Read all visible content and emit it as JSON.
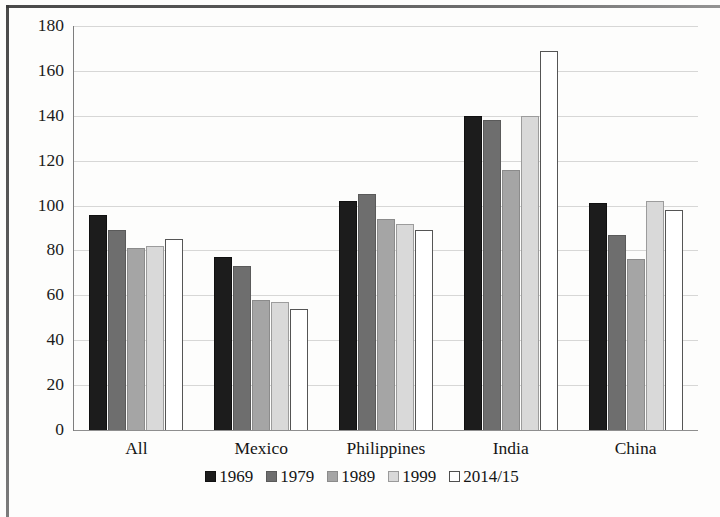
{
  "chart_data": {
    "type": "bar",
    "title": "",
    "subtitle": "",
    "xlabel": "",
    "ylabel": "",
    "categories": [
      "All",
      "Mexico",
      "Philippines",
      "India",
      "China"
    ],
    "series": [
      {
        "name": "1969",
        "color": "#1c1c1c",
        "values": [
          96,
          77,
          102,
          140,
          101
        ]
      },
      {
        "name": "1979",
        "color": "#6e6e6e",
        "values": [
          89,
          73,
          105,
          138,
          87
        ]
      },
      {
        "name": "1989",
        "color": "#a5a5a5",
        "values": [
          81,
          58,
          94,
          116,
          76
        ]
      },
      {
        "name": "1999",
        "color": "#d9d9d9",
        "values": [
          82,
          57,
          92,
          140,
          102
        ]
      },
      {
        "name": "2014/15",
        "color": "#ffffff",
        "values": [
          85,
          54,
          89,
          169,
          98
        ]
      }
    ],
    "ylim": [
      0,
      180
    ],
    "ytick_step": 20,
    "yticks": [
      180,
      160,
      140,
      120,
      100,
      80,
      60,
      40,
      20,
      0
    ],
    "grid": true,
    "legend_position": "bottom"
  },
  "caption": "",
  "icons": {
    "legend_swatch": "square-swatch-icon"
  }
}
